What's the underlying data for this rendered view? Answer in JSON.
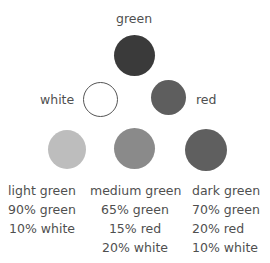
{
  "diagram": {
    "top": {
      "label": "green",
      "color": "#3a3a3a"
    },
    "left": {
      "label": "white",
      "color": "#ffffff"
    },
    "right": {
      "label": "red",
      "color": "#5e5e5e"
    },
    "mixes": [
      {
        "name": "light green",
        "color": "#bdbdbd",
        "lines": [
          "90% green",
          "10% white"
        ]
      },
      {
        "name": "medium green",
        "color": "#8a8a8a",
        "lines": [
          "65% green",
          "15% red",
          "20% white"
        ]
      },
      {
        "name": "dark green",
        "color": "#5f5f5f",
        "lines": [
          "70% green",
          "20% red",
          "10% white"
        ]
      }
    ]
  }
}
